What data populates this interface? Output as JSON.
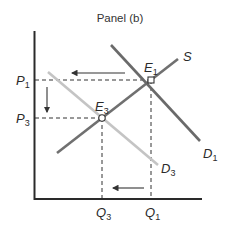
{
  "diagram": {
    "title": "Panel (b)",
    "type": "supply-demand",
    "colors": {
      "axis": "#2a2a2a",
      "supply": "#707070",
      "demand_initial": "#6a6a6a",
      "demand_new": "#c4c4c4",
      "guides": "#333333",
      "arrows": "#333333"
    },
    "curves": {
      "supply": {
        "label": "S"
      },
      "demand_initial": {
        "label_main": "D",
        "label_sub": "1"
      },
      "demand_new": {
        "label_main": "D",
        "label_sub": "3"
      }
    },
    "points": {
      "e1": {
        "label_main": "E",
        "label_sub": "1"
      },
      "e3": {
        "label_main": "E",
        "label_sub": "3"
      }
    },
    "y_axis": {
      "ticks": [
        {
          "label_main": "P",
          "label_sub": "1"
        },
        {
          "label_main": "P",
          "label_sub": "3"
        }
      ]
    },
    "x_axis": {
      "ticks": [
        {
          "label_main": "Q",
          "label_sub": "3"
        },
        {
          "label_main": "Q",
          "label_sub": "1"
        }
      ]
    },
    "arrows": [
      {
        "name": "demand-shift-left",
        "direction": "left"
      },
      {
        "name": "price-decrease",
        "direction": "down"
      },
      {
        "name": "quantity-decrease",
        "direction": "left"
      }
    ]
  }
}
